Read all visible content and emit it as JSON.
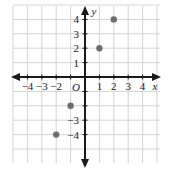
{
  "figure": {
    "origin_label": "O",
    "x_axis_label": "x",
    "y_axis_label": "y",
    "x_tick_labels": [
      "-4",
      "-3",
      "-2",
      "1",
      "2",
      "3",
      "4"
    ],
    "y_tick_labels": [
      "4",
      "3",
      "2",
      "1",
      "-3",
      "-4"
    ],
    "colors": {
      "grid": "#d3d3d3",
      "axis": "#1a1a1a",
      "point": "#6e6e6e",
      "background": "#ffffff"
    }
  },
  "chart_data": {
    "type": "scatter",
    "title": "",
    "xlabel": "x",
    "ylabel": "y",
    "xlim": [
      -5,
      5
    ],
    "ylim": [
      -5,
      5
    ],
    "grid": true,
    "legend": null,
    "x_ticks": [
      -4,
      -3,
      -2,
      -1,
      1,
      2,
      3,
      4
    ],
    "y_ticks": [
      -4,
      -3,
      -2,
      -1,
      1,
      2,
      3,
      4
    ],
    "x_tick_labels_shown": [
      -4,
      -3,
      -2,
      1,
      2,
      3,
      4
    ],
    "y_tick_labels_shown": [
      4,
      3,
      2,
      1,
      -3,
      -4
    ],
    "series": [
      {
        "name": "points",
        "points": [
          {
            "x": -2,
            "y": -4
          },
          {
            "x": -1,
            "y": -2
          },
          {
            "x": 1,
            "y": 2
          },
          {
            "x": 2,
            "y": 4
          }
        ]
      }
    ]
  }
}
